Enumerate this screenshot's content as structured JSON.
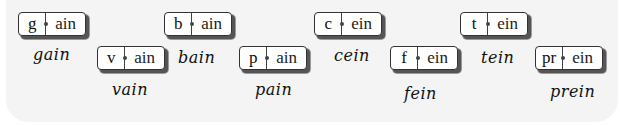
{
  "tiles": [
    {
      "prefix": "g",
      "suffix": "ain",
      "word": "gain"
    },
    {
      "prefix": "v",
      "suffix": "ain",
      "word": "vain"
    },
    {
      "prefix": "b",
      "suffix": "ain",
      "word": "bain"
    },
    {
      "prefix": "p",
      "suffix": "ain",
      "word": "pain"
    },
    {
      "prefix": "c",
      "suffix": "ein",
      "word": "cein"
    },
    {
      "prefix": "f",
      "suffix": "ein",
      "word": "fein"
    },
    {
      "prefix": "t",
      "suffix": "ein",
      "word": "tein"
    },
    {
      "prefix": "pr",
      "suffix": "ein",
      "word": "prein"
    }
  ]
}
